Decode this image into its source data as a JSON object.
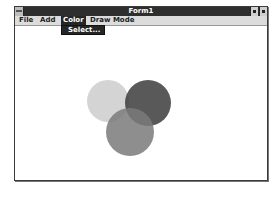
{
  "window": {
    "title": "Form1",
    "controls": {
      "system_menu": "system-menu-icon",
      "minimize": "minimize-icon",
      "maximize": "maximize-icon"
    }
  },
  "menubar": {
    "items": [
      {
        "label": "File"
      },
      {
        "label": "Add"
      },
      {
        "label": "Color",
        "active": true
      },
      {
        "label": "Draw Mode"
      }
    ]
  },
  "dropdown": {
    "parent": "Color",
    "items": [
      {
        "label": "Select..."
      }
    ]
  },
  "canvas": {
    "shapes": [
      {
        "type": "circle",
        "cx": 108,
        "cy": 101,
        "r": 21,
        "color": "#d4d4d4"
      },
      {
        "type": "circle",
        "cx": 148,
        "cy": 103,
        "r": 23,
        "color": "#3c3c3c"
      },
      {
        "type": "circle",
        "cx": 130,
        "cy": 132,
        "r": 24,
        "color": "#7a7a7a"
      }
    ]
  }
}
